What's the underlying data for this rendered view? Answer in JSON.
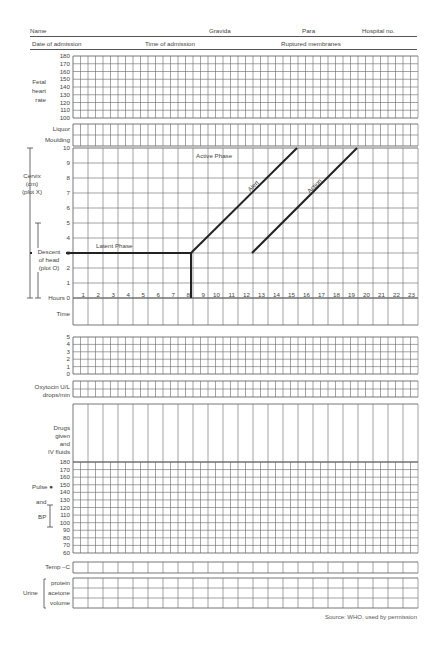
{
  "header": {
    "row1": {
      "name": "Name",
      "gravida": "Gravida",
      "para": "Para",
      "hospital_no": "Hospital no."
    },
    "row2": {
      "date_of_admission": "Date of admission",
      "time_of_admission": "Time of admission",
      "ruptured_membranes": "Ruptured membranes"
    }
  },
  "fetal_heart_rate": {
    "label": [
      "Fetal",
      "heart",
      "rate"
    ],
    "ticks": [
      "180",
      "170",
      "160",
      "150",
      "140",
      "130",
      "120",
      "110",
      "100"
    ]
  },
  "liquor_moulding": {
    "labels": [
      "Liquor",
      "Moulding"
    ]
  },
  "cervix": {
    "cervix_label": [
      "Cervix",
      "(cm)",
      "(plot X)"
    ],
    "descent_label": [
      "Descent",
      "of head",
      "(plot O)"
    ],
    "ticks": [
      "10",
      "9",
      "8",
      "7",
      "6",
      "5",
      "4",
      "3",
      "2",
      "1"
    ],
    "hours_label": "Hours 0",
    "hours": [
      "1",
      "2",
      "3",
      "4",
      "5",
      "6",
      "7",
      "8",
      "9",
      "10",
      "11",
      "12",
      "13",
      "14",
      "15",
      "16",
      "17",
      "18",
      "19",
      "20",
      "21",
      "22",
      "23"
    ],
    "latent_phase_label": "Latent Phase",
    "active_phase_label": "Active Phase",
    "alert_label": "Alert",
    "action_label": "Action"
  },
  "time": {
    "label": "Time"
  },
  "contractions": {
    "ticks": [
      "5",
      "4",
      "3",
      "2",
      "1",
      "0"
    ]
  },
  "oxytocin": {
    "label": [
      "Oxytocin U/L",
      "drops/min"
    ]
  },
  "drugs": {
    "label": [
      "Drugs",
      "given",
      "and",
      "IV fluids"
    ]
  },
  "pulse_bp": {
    "ticks": [
      "180",
      "170",
      "160",
      "150",
      "140",
      "130",
      "120",
      "110",
      "100",
      "90",
      "80",
      "70",
      "60"
    ],
    "pulse_label": "Pulse ●",
    "and_label": "and",
    "bp_label": "BP"
  },
  "temp": {
    "label": "Temp –C"
  },
  "urine": {
    "label": "Urine",
    "rows": [
      "protein",
      "acetone",
      "volume"
    ]
  },
  "footer": {
    "source": "Source: WHO, used by permission"
  }
}
